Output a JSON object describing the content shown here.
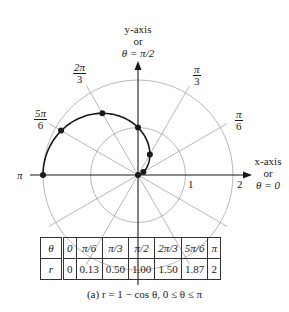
{
  "chart_data": {
    "type": "scatter",
    "coordinate_system": "polar",
    "equation": "r = 1 - cos θ",
    "domain": "0 ≤ θ ≤ π",
    "grid": true,
    "grid_circles": [
      1,
      2
    ],
    "grid_ray_angles_deg": [
      0,
      30,
      60,
      90,
      120,
      150,
      180
    ],
    "r_max": 2,
    "points": [
      {
        "theta_label": "0",
        "theta": 0,
        "r": 0
      },
      {
        "theta_label": "π/6",
        "theta": 0.5236,
        "r": 0.13
      },
      {
        "theta_label": "π/3",
        "theta": 1.0472,
        "r": 0.5
      },
      {
        "theta_label": "π/2",
        "theta": 1.5708,
        "r": 1.0
      },
      {
        "theta_label": "2π/3",
        "theta": 2.0944,
        "r": 1.5
      },
      {
        "theta_label": "5π/6",
        "theta": 2.618,
        "r": 1.87
      },
      {
        "theta_label": "π",
        "theta": 3.1416,
        "r": 2
      }
    ],
    "axis_labels": {
      "x": [
        "x-axis",
        "or",
        "θ = 0"
      ],
      "y": [
        "y-axis",
        "or",
        "θ = π/2"
      ]
    },
    "ray_labels": [
      {
        "num": "π",
        "den": "3"
      },
      {
        "num": "π",
        "den": "6"
      },
      {
        "num": "2π",
        "den": "3"
      },
      {
        "num": "5π",
        "den": "6"
      }
    ],
    "pi_label": "π",
    "circle_tick_labels": [
      "1",
      "2"
    ]
  },
  "table": {
    "row_theta": {
      "header": "θ",
      "cells": [
        "0",
        "π/6",
        "π/3",
        "π/2",
        "2π/3",
        "5π/6",
        "π"
      ]
    },
    "row_r": {
      "header": "r",
      "cells": [
        "0",
        "0.13",
        "0.50",
        "1.00",
        "1.50",
        "1.87",
        "2"
      ]
    }
  },
  "caption": "(a)  r = 1 − cos θ, 0 ≤ θ ≤ π"
}
